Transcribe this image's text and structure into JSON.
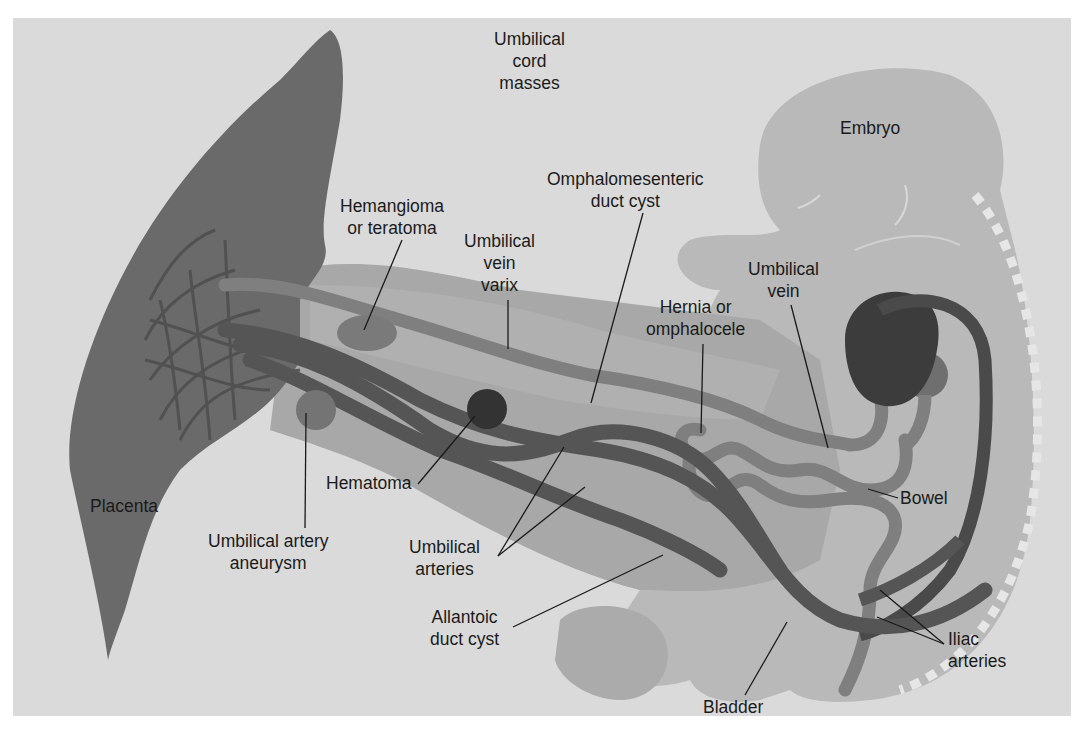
{
  "figure": {
    "subject": "Umbilical cord masses",
    "colors": {
      "background": "#dadada",
      "placenta": "#6a6a6a",
      "cord": "#a8a8a8",
      "embryo": "#b9b9b9",
      "vein": "#7f7f7f",
      "artery": "#555555",
      "heart": "#3c3c3c",
      "label_text": "#1a1a1a"
    },
    "labels": {
      "title": [
        "Umbilical",
        "cord",
        "masses"
      ],
      "embryo": [
        "Embryo"
      ],
      "omphalomesenteric": [
        "Omphalomesenteric",
        "duct cyst"
      ],
      "hemangioma": [
        "Hemangioma",
        "or teratoma"
      ],
      "vein_varix": [
        "Umbilical",
        "vein",
        "varix"
      ],
      "umbilical_vein": [
        "Umbilical",
        "vein"
      ],
      "hernia": [
        "Hernia or",
        "omphalocele"
      ],
      "placenta": [
        "Placenta"
      ],
      "hematoma": [
        "Hematoma"
      ],
      "artery_aneurysm": [
        "Umbilical artery",
        "aneurysm"
      ],
      "umbilical_arteries": [
        "Umbilical",
        "arteries"
      ],
      "bowel": [
        "Bowel"
      ],
      "allantoic": [
        "Allantoic",
        "duct cyst"
      ],
      "iliac": [
        "Iliac",
        "arteries"
      ],
      "bladder": [
        "Bladder"
      ]
    }
  }
}
